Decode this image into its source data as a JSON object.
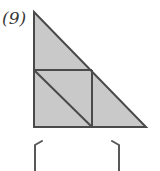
{
  "figure": {
    "problem_label": "(9)",
    "colors": {
      "background": "#ffffff",
      "shape_fill": "#c9c9c9",
      "stroke": "#4a4a4a",
      "label_text": "#3a3a3a",
      "bracket_stroke": "#585858"
    },
    "stroke_width": 2,
    "triangle": {
      "name": "outer-right-triangle",
      "vertices": [
        {
          "label": "apex-top-left",
          "x": 34,
          "y": 12
        },
        {
          "label": "right-angle-bottom-left",
          "x": 34,
          "y": 127
        },
        {
          "label": "bottom-right",
          "x": 146,
          "y": 127
        }
      ],
      "points_attr": "34,12 34,127 146,127",
      "legs": {
        "vertical": 115,
        "horizontal": 112
      }
    },
    "inner_square": {
      "name": "inscribed-square",
      "x": 34,
      "y": 70,
      "width": 58,
      "height": 57,
      "top_edge": "34,70 92,70",
      "right_edge": "92,70 92,127"
    },
    "square_diagonal": {
      "name": "square-diagonal",
      "from": {
        "x": 35,
        "y": 71
      },
      "to": {
        "x": 92,
        "y": 127
      }
    },
    "brackets": [
      {
        "name": "left-bracket",
        "path": "M 42 141 L 35 145 L 35 171",
        "side": "left"
      },
      {
        "name": "right-bracket",
        "path": "M 112 141 L 119 145 L 119 171",
        "side": "right"
      }
    ]
  }
}
